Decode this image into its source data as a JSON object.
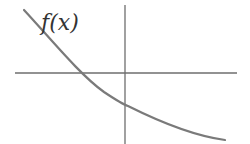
{
  "diagram": {
    "type": "function-graph",
    "function_label": "f(x)",
    "axes": {
      "x_axis": {
        "x1": 15,
        "x2": 237,
        "y": 73
      },
      "y_axis": {
        "x": 125,
        "y1": 5,
        "y2": 144
      }
    },
    "curve": {
      "description": "decreasing, concave-up curve crossing x-axis left of origin and y-axis below origin",
      "path": "M24 10 Q95 105 125 105 Q170 130 225 140"
    },
    "colors": {
      "axis": "#6e6e6e",
      "curve": "#7a7a7a",
      "label": "#333333",
      "background": "#ffffff"
    }
  }
}
